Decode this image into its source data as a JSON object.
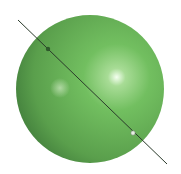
{
  "diagram": {
    "type": "sphere-with-axis-line",
    "sphere": {
      "cx": 90,
      "cy": 89,
      "r": 74,
      "color": "#6bb85a",
      "shade_color": "#3f7a3a",
      "highlight_color": "#f4fff0"
    },
    "line": {
      "x1": 18,
      "y1": 20,
      "x2": 167,
      "y2": 164,
      "color": "#2a3a2a"
    },
    "points": [
      {
        "name": "entry-point",
        "x": 48,
        "y": 49,
        "color": "#2f5a2c"
      },
      {
        "name": "exit-point",
        "x": 133,
        "y": 133,
        "color": "#e8efe4"
      }
    ]
  }
}
